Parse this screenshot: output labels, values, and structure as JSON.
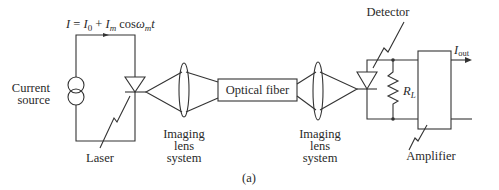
{
  "figure": {
    "caption": "(a)",
    "equation": {
      "lhs": "I",
      "eq": " = ",
      "i0": "I",
      "i0_sub": "0",
      "plus": " + ",
      "im": "I",
      "im_sub": "m",
      "cos": " cos",
      "omega": "ω",
      "omega_sub": "m",
      "t": "t"
    },
    "labels": {
      "current_source_line1": "Current",
      "current_source_line2": "source",
      "laser": "Laser",
      "lens1_line1": "Imaging",
      "lens1_line2": "lens",
      "lens1_line3": "system",
      "optical_fiber": "Optical fiber",
      "lens2_line1": "Imaging",
      "lens2_line2": "lens",
      "lens2_line3": "system",
      "detector": "Detector",
      "resistor": "R",
      "resistor_sub": "L",
      "amplifier": "Amplifier",
      "output": "I",
      "output_sub": "out"
    },
    "colors": {
      "line": "#333333",
      "text": "#2a2a2a",
      "background": "#ffffff"
    }
  }
}
